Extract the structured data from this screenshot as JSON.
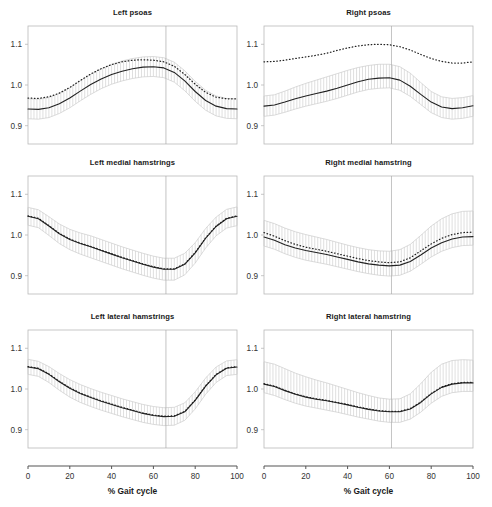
{
  "figure": {
    "rows": 3,
    "cols": 2,
    "background": "#ffffff"
  },
  "axis": {
    "xlabel": "% Gait cycle",
    "xticks": [
      0,
      20,
      40,
      60,
      80,
      100
    ],
    "xlim": [
      0,
      100
    ],
    "yticks": [
      "0.9",
      "1.0",
      "1.1"
    ],
    "ytick_values": [
      0.9,
      1.0,
      1.1
    ],
    "ylim": [
      0.855,
      1.145
    ],
    "frame_color": "#b9b9b9",
    "axis_line_color": "#555555",
    "tick_label_color": "#333333"
  },
  "style": {
    "mean_line_color": "#222222",
    "dotted_line_color": "#222222",
    "band_hatch_color": "#c4c4c4",
    "band_edge_color": "#cccccc",
    "event_line_color": "#aaaaaa"
  },
  "chart_data": [
    {
      "type": "line",
      "title": "Left psoas",
      "position": "row1-col1",
      "xlabel": "% Gait cycle",
      "ylabel": "",
      "xlim": [
        0,
        100
      ],
      "ylim": [
        0.855,
        1.145
      ],
      "grid": false,
      "legend": "none",
      "event_line_x": 66,
      "x": [
        0,
        5,
        10,
        15,
        20,
        25,
        30,
        35,
        40,
        45,
        50,
        55,
        60,
        65,
        70,
        75,
        80,
        85,
        90,
        95,
        100
      ],
      "series": [
        {
          "name": "mean",
          "style": "solid",
          "values": [
            0.941,
            0.94,
            0.944,
            0.954,
            0.968,
            0.985,
            1.001,
            1.015,
            1.026,
            1.034,
            1.04,
            1.044,
            1.045,
            1.042,
            1.031,
            1.01,
            0.984,
            0.962,
            0.948,
            0.942,
            0.941
          ]
        },
        {
          "name": "reference",
          "style": "dotted",
          "values": [
            0.968,
            0.967,
            0.971,
            0.98,
            0.994,
            1.011,
            1.027,
            1.04,
            1.05,
            1.057,
            1.061,
            1.062,
            1.061,
            1.057,
            1.046,
            1.026,
            1.002,
            0.982,
            0.97,
            0.966,
            0.966
          ]
        }
      ],
      "band": {
        "name": "confidence-band",
        "lower": [
          0.917,
          0.916,
          0.92,
          0.93,
          0.944,
          0.961,
          0.977,
          0.991,
          1.002,
          1.01,
          1.016,
          1.02,
          1.021,
          1.018,
          1.007,
          0.986,
          0.96,
          0.938,
          0.924,
          0.918,
          0.917
        ],
        "upper": [
          0.966,
          0.965,
          0.969,
          0.979,
          0.993,
          1.01,
          1.026,
          1.04,
          1.051,
          1.059,
          1.065,
          1.069,
          1.07,
          1.067,
          1.056,
          1.035,
          1.009,
          0.987,
          0.973,
          0.967,
          0.966
        ]
      }
    },
    {
      "type": "line",
      "title": "Right psoas",
      "position": "row1-col2",
      "xlabel": "% Gait cycle",
      "ylabel": "",
      "xlim": [
        0,
        100
      ],
      "ylim": [
        0.855,
        1.145
      ],
      "grid": false,
      "legend": "none",
      "event_line_x": 61,
      "x": [
        0,
        5,
        10,
        15,
        20,
        25,
        30,
        35,
        40,
        45,
        50,
        55,
        60,
        65,
        70,
        75,
        80,
        85,
        90,
        95,
        100
      ],
      "series": [
        {
          "name": "mean",
          "style": "solid",
          "values": [
            0.948,
            0.951,
            0.958,
            0.966,
            0.973,
            0.979,
            0.985,
            0.992,
            1.0,
            1.008,
            1.014,
            1.017,
            1.018,
            1.012,
            0.997,
            0.977,
            0.958,
            0.946,
            0.942,
            0.944,
            0.949
          ]
        },
        {
          "name": "reference",
          "style": "dotted",
          "values": [
            1.057,
            1.058,
            1.061,
            1.065,
            1.069,
            1.073,
            1.078,
            1.085,
            1.091,
            1.096,
            1.099,
            1.1,
            1.099,
            1.094,
            1.086,
            1.075,
            1.065,
            1.058,
            1.054,
            1.054,
            1.057
          ]
        }
      ],
      "band": {
        "name": "confidence-band",
        "lower": [
          0.923,
          0.926,
          0.933,
          0.941,
          0.948,
          0.954,
          0.96,
          0.967,
          0.975,
          0.983,
          0.989,
          0.992,
          0.993,
          0.987,
          0.972,
          0.952,
          0.932,
          0.92,
          0.916,
          0.918,
          0.923
        ],
        "upper": [
          0.973,
          0.976,
          0.985,
          0.995,
          1.004,
          1.012,
          1.02,
          1.028,
          1.036,
          1.043,
          1.048,
          1.051,
          1.051,
          1.045,
          1.029,
          1.006,
          0.984,
          0.971,
          0.967,
          0.969,
          0.974
        ]
      }
    },
    {
      "type": "line",
      "title": "Left medial hamstrings",
      "position": "row2-col1",
      "xlabel": "% Gait cycle",
      "ylabel": "",
      "xlim": [
        0,
        100
      ],
      "ylim": [
        0.855,
        1.145
      ],
      "grid": false,
      "legend": "none",
      "event_line_x": 66,
      "x": [
        0,
        5,
        10,
        15,
        20,
        25,
        30,
        35,
        40,
        45,
        50,
        55,
        60,
        65,
        70,
        75,
        80,
        85,
        90,
        95,
        100
      ],
      "series": [
        {
          "name": "mean",
          "style": "solid",
          "values": [
            1.046,
            1.04,
            1.022,
            1.003,
            0.989,
            0.979,
            0.971,
            0.962,
            0.953,
            0.944,
            0.936,
            0.928,
            0.921,
            0.916,
            0.916,
            0.928,
            0.956,
            0.992,
            1.021,
            1.04,
            1.046
          ]
        },
        {
          "name": "reference",
          "style": "dotted",
          "values": [
            1.047,
            1.041,
            1.023,
            1.004,
            0.99,
            0.98,
            0.972,
            0.963,
            0.954,
            0.945,
            0.937,
            0.929,
            0.922,
            0.917,
            0.917,
            0.929,
            0.957,
            0.993,
            1.022,
            1.041,
            1.047
          ]
        }
      ],
      "band": {
        "name": "confidence-band",
        "lower": [
          1.024,
          1.018,
          0.999,
          0.979,
          0.964,
          0.953,
          0.944,
          0.935,
          0.926,
          0.917,
          0.909,
          0.901,
          0.894,
          0.889,
          0.889,
          0.902,
          0.931,
          0.968,
          0.998,
          1.017,
          1.023
        ],
        "upper": [
          1.068,
          1.062,
          1.045,
          1.027,
          1.014,
          1.005,
          0.998,
          0.989,
          0.98,
          0.971,
          0.963,
          0.955,
          0.948,
          0.943,
          0.943,
          0.955,
          0.981,
          1.016,
          1.044,
          1.063,
          1.069
        ]
      }
    },
    {
      "type": "line",
      "title": "Right medial hamstring",
      "position": "row2-col2",
      "xlabel": "% Gait cycle",
      "ylabel": "",
      "xlim": [
        0,
        100
      ],
      "ylim": [
        0.855,
        1.145
      ],
      "grid": false,
      "legend": "none",
      "event_line_x": 61,
      "x": [
        0,
        5,
        10,
        15,
        20,
        25,
        30,
        35,
        40,
        45,
        50,
        55,
        60,
        65,
        70,
        75,
        80,
        85,
        90,
        95,
        100
      ],
      "series": [
        {
          "name": "mean",
          "style": "solid",
          "values": [
            0.995,
            0.987,
            0.976,
            0.968,
            0.962,
            0.957,
            0.952,
            0.946,
            0.94,
            0.934,
            0.929,
            0.926,
            0.924,
            0.926,
            0.935,
            0.951,
            0.968,
            0.981,
            0.99,
            0.995,
            0.996
          ]
        },
        {
          "name": "reference",
          "style": "dotted",
          "values": [
            1.006,
            0.997,
            0.986,
            0.977,
            0.97,
            0.965,
            0.96,
            0.954,
            0.948,
            0.942,
            0.937,
            0.934,
            0.932,
            0.934,
            0.944,
            0.961,
            0.978,
            0.992,
            1.001,
            1.006,
            1.007
          ]
        }
      ],
      "band": {
        "name": "confidence-band",
        "lower": [
          0.973,
          0.965,
          0.954,
          0.945,
          0.938,
          0.933,
          0.928,
          0.922,
          0.916,
          0.91,
          0.905,
          0.901,
          0.899,
          0.901,
          0.911,
          0.928,
          0.946,
          0.96,
          0.969,
          0.974,
          0.975
        ],
        "upper": [
          1.036,
          1.028,
          1.017,
          1.008,
          1.001,
          0.995,
          0.989,
          0.982,
          0.975,
          0.969,
          0.964,
          0.961,
          0.96,
          0.964,
          0.977,
          0.999,
          1.022,
          1.04,
          1.052,
          1.058,
          1.059
        ]
      }
    },
    {
      "type": "line",
      "title": "Left lateral hamstrings",
      "position": "row3-col1",
      "xlabel": "% Gait cycle",
      "ylabel": "",
      "xlim": [
        0,
        100
      ],
      "ylim": [
        0.855,
        1.145
      ],
      "grid": false,
      "legend": "none",
      "event_line_x": 66,
      "x": [
        0,
        5,
        10,
        15,
        20,
        25,
        30,
        35,
        40,
        45,
        50,
        55,
        60,
        65,
        70,
        75,
        80,
        85,
        90,
        95,
        100
      ],
      "series": [
        {
          "name": "mean",
          "style": "solid",
          "values": [
            1.054,
            1.05,
            1.036,
            1.018,
            1.002,
            0.989,
            0.979,
            0.97,
            0.962,
            0.954,
            0.947,
            0.94,
            0.935,
            0.932,
            0.933,
            0.944,
            0.972,
            1.007,
            1.035,
            1.051,
            1.054
          ]
        },
        {
          "name": "reference",
          "style": "dotted",
          "values": [
            1.055,
            1.051,
            1.037,
            1.019,
            1.003,
            0.99,
            0.98,
            0.971,
            0.963,
            0.955,
            0.948,
            0.941,
            0.936,
            0.933,
            0.934,
            0.945,
            0.973,
            1.008,
            1.036,
            1.052,
            1.055
          ]
        }
      ],
      "band": {
        "name": "confidence-band",
        "lower": [
          1.036,
          1.031,
          1.016,
          0.997,
          0.98,
          0.967,
          0.957,
          0.948,
          0.94,
          0.932,
          0.925,
          0.918,
          0.913,
          0.91,
          0.911,
          0.923,
          0.951,
          0.987,
          1.016,
          1.033,
          1.036
        ],
        "upper": [
          1.073,
          1.068,
          1.055,
          1.038,
          1.023,
          1.011,
          1.001,
          0.992,
          0.984,
          0.976,
          0.969,
          0.962,
          0.957,
          0.954,
          0.955,
          0.966,
          0.993,
          1.027,
          1.054,
          1.069,
          1.072
        ]
      }
    },
    {
      "type": "line",
      "title": "Right lateral hamstring",
      "position": "row3-col2",
      "xlabel": "% Gait cycle",
      "ylabel": "",
      "xlim": [
        0,
        100
      ],
      "ylim": [
        0.855,
        1.145
      ],
      "grid": false,
      "legend": "none",
      "event_line_x": 61,
      "x": [
        0,
        5,
        10,
        15,
        20,
        25,
        30,
        35,
        40,
        45,
        50,
        55,
        60,
        65,
        70,
        75,
        80,
        85,
        90,
        95,
        100
      ],
      "series": [
        {
          "name": "mean",
          "style": "solid",
          "values": [
            1.012,
            1.006,
            0.996,
            0.987,
            0.98,
            0.975,
            0.971,
            0.966,
            0.961,
            0.955,
            0.95,
            0.946,
            0.944,
            0.944,
            0.951,
            0.967,
            0.988,
            1.004,
            1.012,
            1.015,
            1.015
          ]
        },
        {
          "name": "reference",
          "style": "dotted",
          "values": [
            1.013,
            1.007,
            0.997,
            0.988,
            0.981,
            0.976,
            0.972,
            0.967,
            0.962,
            0.956,
            0.951,
            0.947,
            0.945,
            0.945,
            0.952,
            0.968,
            0.989,
            1.005,
            1.013,
            1.016,
            1.016
          ]
        }
      ],
      "band": {
        "name": "confidence-band",
        "lower": [
          0.991,
          0.984,
          0.974,
          0.965,
          0.958,
          0.953,
          0.948,
          0.943,
          0.937,
          0.931,
          0.926,
          0.921,
          0.918,
          0.918,
          0.926,
          0.943,
          0.965,
          0.982,
          0.991,
          0.994,
          0.994
        ],
        "upper": [
          1.067,
          1.061,
          1.05,
          1.039,
          1.03,
          1.022,
          1.015,
          1.007,
          0.999,
          0.991,
          0.984,
          0.978,
          0.975,
          0.976,
          0.988,
          1.013,
          1.041,
          1.061,
          1.07,
          1.072,
          1.071
        ]
      }
    }
  ]
}
